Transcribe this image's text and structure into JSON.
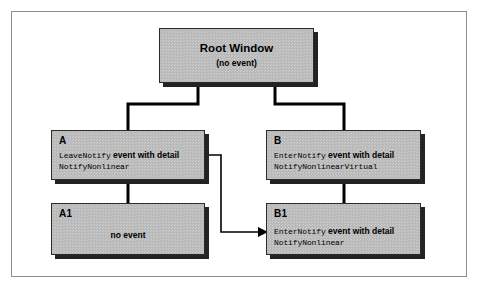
{
  "figure": {
    "colors": {
      "box_fill": "#b9b9b9",
      "box_border": "#2b2b2b",
      "shadow": "#232323",
      "frame": "#8d8d8d",
      "background": "#ffffff",
      "line": "#000000"
    }
  },
  "nodes": {
    "root": {
      "title": "Root Window",
      "subtitle": "(no event)"
    },
    "a": {
      "tag": "A",
      "line1_code": "LeaveNotify",
      "line1_text": "event with detail",
      "line2_code": "NotifyNonlinear"
    },
    "a1": {
      "tag": "A1",
      "text": "no event"
    },
    "b": {
      "tag": "B",
      "line1_code": "EnterNotify",
      "line1_text": "event with detail",
      "line2_code": "NotifyNonlinearVirtual"
    },
    "b1": {
      "tag": "B1",
      "line1_code": "EnterNotify",
      "line1_text": "event with detail",
      "line2_code": "NotifyNonlinear"
    }
  },
  "connectors": [
    {
      "name": "root-to-a",
      "from": "root",
      "to": "a",
      "style": "elbow"
    },
    {
      "name": "root-to-b",
      "from": "root",
      "to": "b",
      "style": "elbow"
    },
    {
      "name": "a-to-a1",
      "from": "a",
      "to": "a1",
      "style": "straight"
    },
    {
      "name": "b-to-b1",
      "from": "b",
      "to": "b1",
      "style": "straight"
    },
    {
      "name": "a-to-b1-pointer",
      "from": "a",
      "to": "b1",
      "style": "arrow"
    }
  ]
}
